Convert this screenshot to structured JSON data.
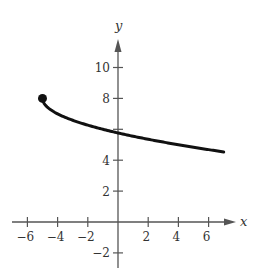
{
  "chart_data": {
    "type": "line",
    "title": "",
    "xlabel": "x",
    "ylabel": "y",
    "xlim": [
      -7,
      8
    ],
    "ylim": [
      -3,
      11.5
    ],
    "xticks": [
      -6,
      -4,
      -2,
      2,
      4,
      6
    ],
    "yticks": [
      -2,
      2,
      4,
      6,
      8,
      10
    ],
    "xtick_labels": [
      "−6",
      "−4",
      "−2",
      "2",
      "4",
      "6"
    ],
    "ytick_labels": [
      "−2",
      "2",
      "4",
      "",
      "8",
      "10"
    ],
    "grid": false,
    "legend": null,
    "series": [
      {
        "name": "f(x) = 8 − √(x + 5)",
        "x": [
          -5,
          -4.9,
          -4.5,
          -4,
          -3,
          -2,
          -1,
          0,
          1,
          2,
          3,
          4,
          5,
          6,
          7
        ],
        "y": [
          8,
          7.68,
          7.29,
          7,
          6.59,
          6.27,
          5.55,
          5.76,
          5.55,
          5.35,
          5.17,
          5,
          4.84,
          4.68,
          4.54
        ],
        "endpoint_closed": {
          "x": -5,
          "y": 8
        }
      }
    ]
  }
}
